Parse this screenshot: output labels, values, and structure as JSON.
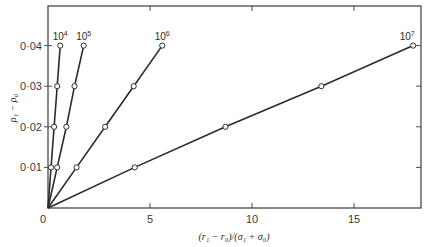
{
  "chart_data": {
    "type": "line",
    "title": "",
    "xlabel": "(r₁ − r₀)/(σ₁ + σ₀)",
    "ylabel": "ρ₁ − ρ₀",
    "xlim": [
      0,
      18.2
    ],
    "ylim": [
      0,
      0.05
    ],
    "x_ticks": [
      0,
      5,
      10,
      15
    ],
    "x_tick_labels": [
      "0",
      "5",
      "10",
      "15"
    ],
    "y_ticks": [
      0.01,
      0.02,
      0.03,
      0.04
    ],
    "y_tick_labels": [
      "0·01",
      "0·02",
      "0·03",
      "0·04"
    ],
    "grid": false,
    "frame": "box",
    "legend": "inline labels at line ends",
    "series": [
      {
        "name": "10^4",
        "label_base": "10",
        "label_exp": "4",
        "points": [
          [
            0,
            0
          ],
          [
            0.15,
            0.01
          ],
          [
            0.3,
            0.02
          ],
          [
            0.45,
            0.03
          ],
          [
            0.6,
            0.04
          ]
        ]
      },
      {
        "name": "10^5",
        "label_base": "10",
        "label_exp": "5",
        "points": [
          [
            0,
            0
          ],
          [
            0.45,
            0.01
          ],
          [
            0.9,
            0.02
          ],
          [
            1.3,
            0.03
          ],
          [
            1.75,
            0.04
          ]
        ]
      },
      {
        "name": "10^6",
        "label_base": "10",
        "label_exp": "6",
        "points": [
          [
            0,
            0
          ],
          [
            1.4,
            0.01
          ],
          [
            2.8,
            0.02
          ],
          [
            4.2,
            0.03
          ],
          [
            5.6,
            0.04
          ]
        ]
      },
      {
        "name": "10^7",
        "label_base": "10",
        "label_exp": "7",
        "points": [
          [
            0,
            0
          ],
          [
            4.25,
            0.01
          ],
          [
            8.7,
            0.02
          ],
          [
            13.4,
            0.03
          ],
          [
            17.9,
            0.04
          ]
        ]
      }
    ]
  },
  "colors": {
    "line": "#2b2b2b",
    "marker_fill": "#ffffff",
    "frame": "#4a4a4a",
    "background": "#ffffff"
  }
}
